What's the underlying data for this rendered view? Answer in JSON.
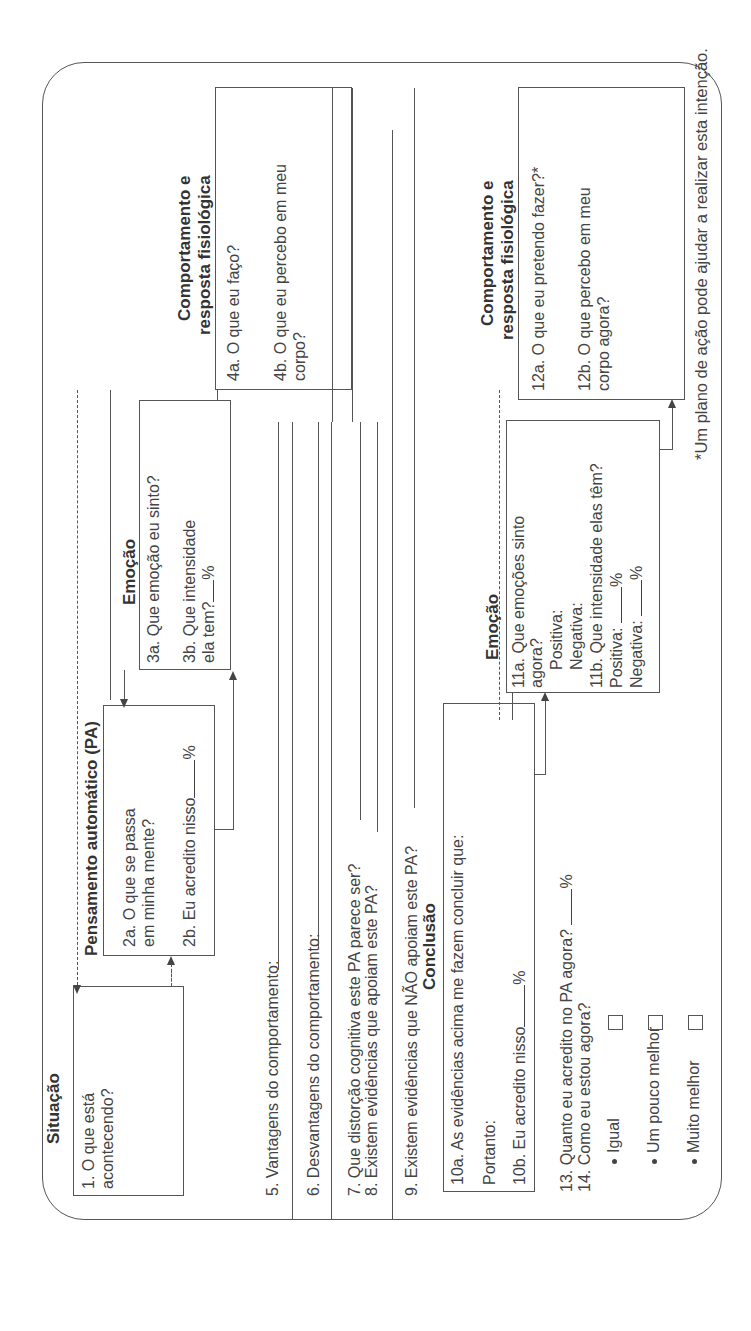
{
  "worksheet": {
    "situacao": {
      "title": "Situação",
      "q1": "1. O que está",
      "q1b": "acontecendo?"
    },
    "pa": {
      "title": "Pensamento automático (PA)",
      "q2a": "2a. O que se passa",
      "q2a2": "em minha mente?",
      "q2b": "2b. Eu acredito nisso",
      "q2b_unit": "%"
    },
    "emocao": {
      "title": "Emoção",
      "q3a": "3a. Que emoção eu sinto?",
      "q3b": "3b. Que intensidade",
      "q3b2": "ela tem?",
      "q3b_unit": "%"
    },
    "comportamento": {
      "title_line1": "Comportamento e",
      "title_line2": "resposta fisiológica",
      "q4a": "4a. O que eu faço?",
      "q4b": "4b. O que eu percebo em meu",
      "q4b2": "corpo?"
    },
    "questions": {
      "q5": "5. Vantagens do comportamento:",
      "q6": "6. Desvantagens do comportamento:",
      "q7": "7. Que distorção cognitiva este PA parece ser?",
      "q8": "8. Existem evidências que apoiam este PA?",
      "q9": "9. Existem evidências que NÃO apoiam este PA?"
    },
    "conclusao": {
      "title": "Conclusão",
      "q10a": "10a. As evidências acima me fazem concluir que:",
      "portanto": "Portanto:",
      "q10b": "10b. Eu acredito nisso",
      "q10b_unit": "%"
    },
    "emocao2": {
      "title": "Emoção",
      "q11a": "11a. Que emoções sinto",
      "q11a2": "agora?",
      "positiva": "Positiva:",
      "negativa": "Negativa:",
      "q11b": "11b. Que intensidade elas têm?",
      "positiva2": "Positiva:",
      "negativa2": "Negativa:",
      "unit": "%"
    },
    "comportamento2": {
      "title_line1": "Comportamento e",
      "title_line2": "resposta fisiológica",
      "q12a": "12a. O que eu pretendo fazer?*",
      "q12b": "12b. O que percebo em meu",
      "q12b2": "corpo agora?"
    },
    "final": {
      "q13": "13. Quanto eu acredito no PA agora?",
      "q13_unit": "%",
      "q14": "14. Como eu estou agora?",
      "options": [
        {
          "label": "Igual",
          "checked": false
        },
        {
          "label": "Um pouco melhor",
          "checked": false
        },
        {
          "label": "Muito melhor",
          "checked": false
        }
      ]
    },
    "footnote": "*Um plano de ação pode ajudar a realizar esta intenção."
  }
}
